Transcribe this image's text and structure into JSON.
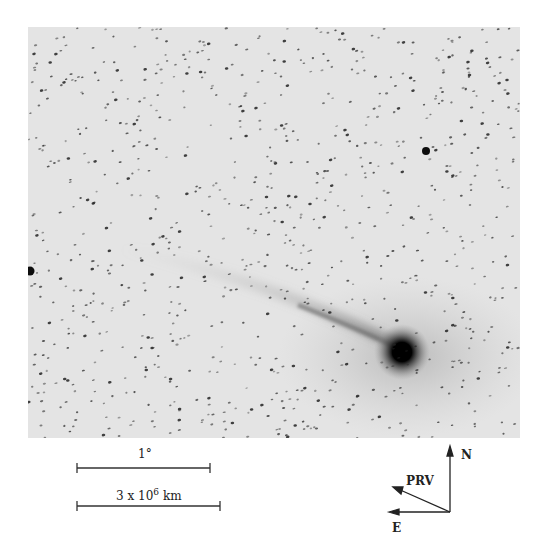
{
  "figure": {
    "background_color": "#e6e6e6",
    "comet": {
      "nucleus_x": 402,
      "nucleus_y": 352,
      "tail_direction": "upper-left"
    }
  },
  "scale_bars": [
    {
      "label": "1°",
      "x1": 77,
      "x2": 210,
      "y": 468
    },
    {
      "label_base": "3 x 10",
      "label_exp": "6",
      "label_unit": "km",
      "x1": 77,
      "x2": 220,
      "y": 506
    }
  ],
  "compass": {
    "north_label": "N",
    "east_label": "E",
    "velocity_label": "PRV",
    "origin": [
      450,
      512
    ]
  }
}
